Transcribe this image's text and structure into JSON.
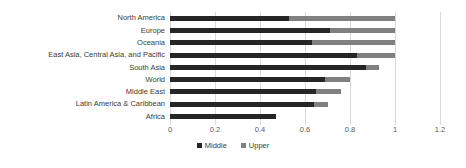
{
  "chart": {
    "colors": {
      "middle": "#262626",
      "upper": "#808080",
      "gridline": "#d9d9d9",
      "category_label": "#3b3b3b",
      "tick_label": "#595959",
      "background": "#ffffff"
    },
    "legend": [
      {
        "label": "Middle",
        "color_key": "middle"
      },
      {
        "label": "Upper",
        "color_key": "upper"
      }
    ]
  },
  "chart_data": {
    "type": "bar",
    "orientation": "horizontal",
    "stacked": true,
    "title": "",
    "xlabel": "",
    "ylabel": "",
    "categories": [
      "North America",
      "Europe",
      "Oceania",
      "East Asia, Central Asia, and Pacific",
      "South Asia",
      "World",
      "Middle East",
      "Latin America & Caribbean",
      "Africa"
    ],
    "series": [
      {
        "name": "Middle",
        "values": [
          0.53,
          0.71,
          0.63,
          0.83,
          0.87,
          0.69,
          0.65,
          0.64,
          0.47
        ]
      },
      {
        "name": "Upper",
        "values": [
          0.47,
          0.29,
          0.37,
          0.17,
          0.06,
          0.11,
          0.11,
          0.06,
          0.0
        ]
      }
    ],
    "xlim": [
      0,
      1.2
    ],
    "xticks": [
      0,
      0.2,
      0.4,
      0.6,
      0.8,
      1,
      1.2
    ],
    "xtick_labels": [
      "0",
      "0.2",
      "0.4",
      "0.6",
      "0.8",
      "1",
      "1.2"
    ],
    "grid": true,
    "legend_position": "bottom"
  }
}
